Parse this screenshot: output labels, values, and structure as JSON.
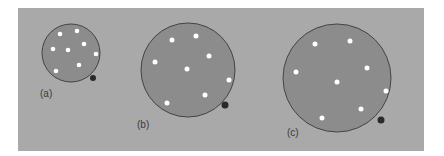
{
  "figure": {
    "background_color": "#a9a9a9",
    "balloon_color": "#8c8c8c",
    "dot_color": "#ffffff",
    "balloons": [
      {
        "label": "(a)",
        "dot_count": 8
      },
      {
        "label": "(b)",
        "dot_count": 8
      },
      {
        "label": "(c)",
        "dot_count": 8
      }
    ]
  }
}
